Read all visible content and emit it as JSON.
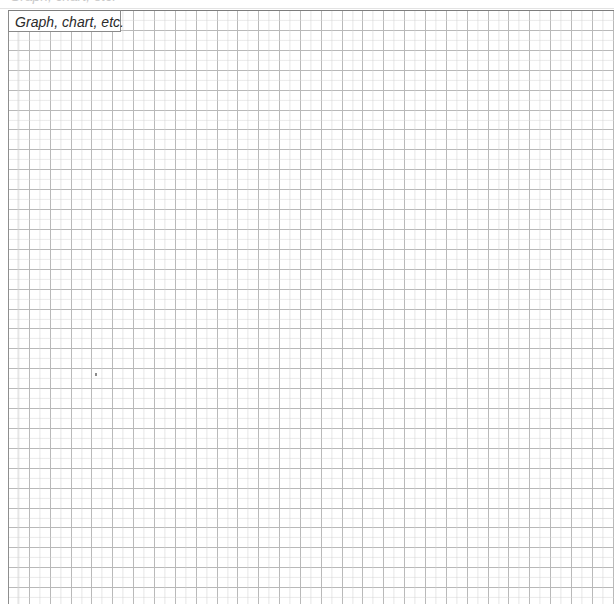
{
  "document": {
    "type": "spreadsheet-grid",
    "background_color": "#ffffff",
    "grid_line_color": "#b9b9b9",
    "grid_border_color": "#8a8a8a"
  },
  "ghost_row": {
    "clipped_text": "Graph, chart, etc."
  },
  "merged_cell": {
    "label": "Graph, chart, etc.",
    "text_color": "#2b2b2b",
    "style": "italic"
  },
  "grid": {
    "cell_width": 20.85,
    "cell_height": 19.9,
    "columns": 29,
    "rows": 30,
    "origin_x": 8,
    "origin_y": 10
  },
  "annotations": {
    "stray_mark": {
      "x": 87,
      "y": 363,
      "color": "#8c8c8c"
    }
  }
}
